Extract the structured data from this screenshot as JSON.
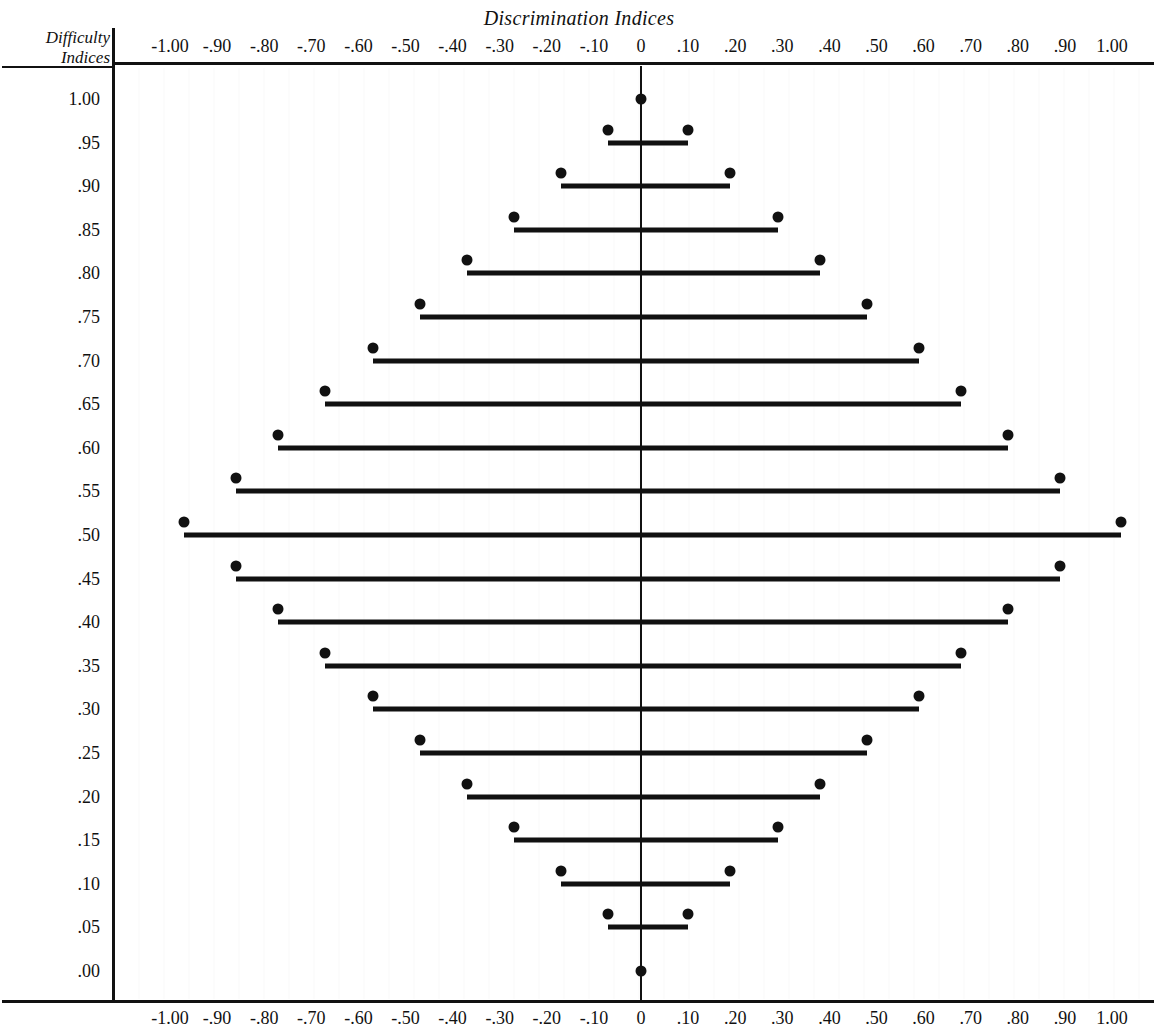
{
  "chart_data": {
    "type": "bar",
    "title": "Discrimination Indices",
    "xlabel": "Discrimination Indices",
    "ylabel": "Difficulty Indices",
    "grid": false,
    "legend": null,
    "xlim": [
      -1.0,
      1.0
    ],
    "ylim": [
      0.0,
      1.0
    ],
    "orientation": "horizontal",
    "x_ticks": [
      "-1.00",
      "-.90",
      "-.80",
      "-.70",
      "-.60",
      "-.50",
      "-.40",
      "-.30",
      "-.20",
      "-.10",
      "0",
      ".10",
      ".20",
      ".30",
      ".40",
      ".50",
      ".60",
      ".70",
      ".80",
      ".90",
      "1.00"
    ],
    "x_tick_values": [
      -1.0,
      -0.9,
      -0.8,
      -0.7,
      -0.6,
      -0.5,
      -0.4,
      -0.3,
      -0.2,
      -0.1,
      0,
      0.1,
      0.2,
      0.3,
      0.4,
      0.5,
      0.6,
      0.7,
      0.8,
      0.9,
      1.0
    ],
    "y_ticks": [
      "1.00",
      ".95",
      ".90",
      ".85",
      ".80",
      ".75",
      ".70",
      ".65",
      ".60",
      ".55",
      ".50",
      ".45",
      ".40",
      ".35",
      ".30",
      ".25",
      ".20",
      ".15",
      ".10",
      ".05",
      ".00"
    ],
    "y_tick_values": [
      1.0,
      0.95,
      0.9,
      0.85,
      0.8,
      0.75,
      0.7,
      0.65,
      0.6,
      0.55,
      0.5,
      0.45,
      0.4,
      0.35,
      0.3,
      0.25,
      0.2,
      0.15,
      0.1,
      0.05,
      0.0
    ],
    "categories": [
      "1.00",
      ".95",
      ".90",
      ".85",
      ".80",
      ".75",
      ".70",
      ".65",
      ".60",
      ".55",
      ".50",
      ".45",
      ".40",
      ".35",
      ".30",
      ".25",
      ".20",
      ".15",
      ".10",
      ".05",
      ".00"
    ],
    "rows": [
      {
        "difficulty": 1.0,
        "low": 0.0,
        "high": 0.0
      },
      {
        "difficulty": 0.95,
        "low": -0.07,
        "high": 0.1
      },
      {
        "difficulty": 0.9,
        "low": -0.17,
        "high": 0.19
      },
      {
        "difficulty": 0.85,
        "low": -0.27,
        "high": 0.29
      },
      {
        "difficulty": 0.8,
        "low": -0.37,
        "high": 0.38
      },
      {
        "difficulty": 0.75,
        "low": -0.47,
        "high": 0.48
      },
      {
        "difficulty": 0.7,
        "low": -0.57,
        "high": 0.59
      },
      {
        "difficulty": 0.65,
        "low": -0.67,
        "high": 0.68
      },
      {
        "difficulty": 0.6,
        "low": -0.77,
        "high": 0.78
      },
      {
        "difficulty": 0.55,
        "low": -0.86,
        "high": 0.89
      },
      {
        "difficulty": 0.5,
        "low": -0.97,
        "high": 1.02
      },
      {
        "difficulty": 0.45,
        "low": -0.86,
        "high": 0.89
      },
      {
        "difficulty": 0.4,
        "low": -0.77,
        "high": 0.78
      },
      {
        "difficulty": 0.35,
        "low": -0.67,
        "high": 0.68
      },
      {
        "difficulty": 0.3,
        "low": -0.57,
        "high": 0.59
      },
      {
        "difficulty": 0.25,
        "low": -0.47,
        "high": 0.48
      },
      {
        "difficulty": 0.2,
        "low": -0.37,
        "high": 0.38
      },
      {
        "difficulty": 0.15,
        "low": -0.27,
        "high": 0.29
      },
      {
        "difficulty": 0.1,
        "low": -0.17,
        "high": 0.19
      },
      {
        "difficulty": 0.05,
        "low": -0.07,
        "high": 0.1
      },
      {
        "difficulty": 0.0,
        "low": 0.0,
        "high": 0.0
      }
    ]
  }
}
